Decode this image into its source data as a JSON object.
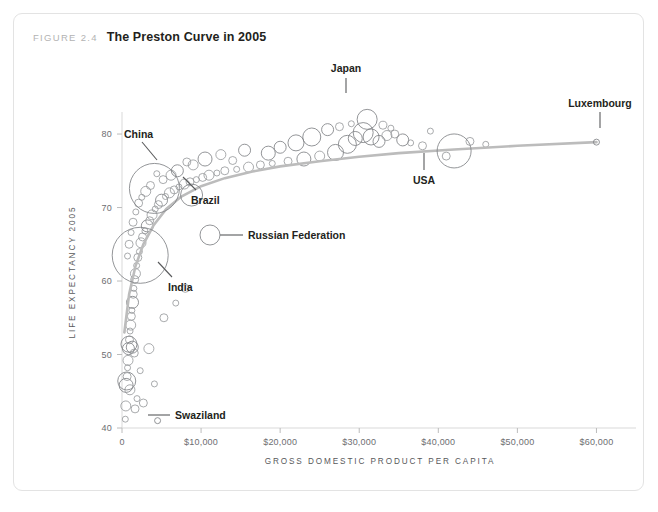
{
  "figure": {
    "number_label": "FIGURE 2.4",
    "title": "The Preston Curve in 2005"
  },
  "chart_data": {
    "type": "scatter",
    "title": "The Preston Curve in 2005",
    "xlabel": "GROSS DOMESTIC PRODUCT PER CAPITA",
    "ylabel": "LIFE EXPECTANCY 2005",
    "xlim": [
      0,
      65000
    ],
    "ylim": [
      40,
      83
    ],
    "grid": false,
    "legend": "none",
    "x_ticks": [
      0,
      10000,
      20000,
      30000,
      40000,
      50000,
      60000
    ],
    "x_tick_labels": [
      "0",
      "$10,000",
      "$20,000",
      "$30,000",
      "$40,000",
      "$50,000",
      "$60,000"
    ],
    "y_ticks": [
      40,
      50,
      60,
      70,
      80
    ],
    "y_tick_labels": [
      "40",
      "50",
      "60",
      "70",
      "80"
    ],
    "bubble_encoding": "population",
    "series_name": "Countries",
    "annotations": [
      {
        "label": "China",
        "x": 4100,
        "y": 72.6,
        "r": 25
      },
      {
        "label": "Brazil",
        "x": 8800,
        "y": 71.7,
        "r": 11
      },
      {
        "label": "Russian Federation",
        "x": 11900,
        "y": 65.5,
        "r": 10
      },
      {
        "label": "India",
        "x": 2300,
        "y": 63.5,
        "r": 28
      },
      {
        "label": "Japan",
        "x": 31000,
        "y": 82.0,
        "r": 10
      },
      {
        "label": "USA",
        "x": 42000,
        "y": 77.7,
        "r": 17
      },
      {
        "label": "Luxembourg",
        "x": 60000,
        "y": 78.9,
        "r": 3
      },
      {
        "label": "Swaziland",
        "x": 4500,
        "y": 41.0,
        "r": 3
      }
    ],
    "trend_curve": [
      [
        300,
        53.0
      ],
      [
        900,
        58.2
      ],
      [
        1700,
        62.0
      ],
      [
        2700,
        65.0
      ],
      [
        4000,
        67.6
      ],
      [
        5600,
        69.8
      ],
      [
        7500,
        71.5
      ],
      [
        10000,
        72.9
      ],
      [
        13000,
        74.0
      ],
      [
        16500,
        74.9
      ],
      [
        20000,
        75.6
      ],
      [
        25000,
        76.3
      ],
      [
        30000,
        76.9
      ],
      [
        35000,
        77.4
      ],
      [
        42000,
        77.9
      ],
      [
        50000,
        78.4
      ],
      [
        60000,
        78.9
      ]
    ],
    "points": [
      [
        420,
        41.2,
        3
      ],
      [
        480,
        43.0,
        5
      ],
      [
        520,
        45.8,
        7
      ],
      [
        600,
        46.4,
        9
      ],
      [
        650,
        47.0,
        4
      ],
      [
        700,
        48.2,
        3
      ],
      [
        760,
        49.2,
        5
      ],
      [
        820,
        50.8,
        6
      ],
      [
        880,
        51.4,
        8
      ],
      [
        950,
        52.0,
        4
      ],
      [
        1020,
        53.2,
        3
      ],
      [
        1100,
        54.0,
        5
      ],
      [
        1180,
        55.2,
        4
      ],
      [
        1250,
        56.0,
        3
      ],
      [
        1330,
        57.1,
        6
      ],
      [
        1420,
        58.2,
        4
      ],
      [
        1500,
        59.0,
        3
      ],
      [
        1600,
        60.2,
        4
      ],
      [
        1700,
        61.0,
        5
      ],
      [
        1850,
        62.1,
        3
      ],
      [
        2000,
        63.2,
        4
      ],
      [
        2200,
        64.0,
        3
      ],
      [
        2400,
        65.2,
        5
      ],
      [
        2600,
        66.0,
        4
      ],
      [
        2900,
        66.8,
        3
      ],
      [
        3200,
        67.5,
        6
      ],
      [
        3500,
        68.2,
        4
      ],
      [
        3800,
        69.0,
        5
      ],
      [
        4200,
        69.8,
        3
      ],
      [
        4600,
        70.4,
        4
      ],
      [
        5000,
        71.0,
        6
      ],
      [
        5500,
        71.5,
        3
      ],
      [
        6000,
        72.0,
        5
      ],
      [
        6600,
        72.4,
        4
      ],
      [
        7200,
        72.8,
        3
      ],
      [
        7900,
        73.2,
        5
      ],
      [
        8600,
        73.5,
        4
      ],
      [
        9400,
        73.8,
        3
      ],
      [
        10200,
        74.1,
        4
      ],
      [
        11000,
        74.4,
        5
      ],
      [
        12000,
        74.7,
        3
      ],
      [
        13000,
        75.0,
        4
      ],
      [
        14500,
        75.2,
        3
      ],
      [
        16000,
        75.5,
        5
      ],
      [
        17500,
        75.8,
        4
      ],
      [
        19000,
        76.0,
        3
      ],
      [
        21000,
        76.3,
        4
      ],
      [
        23000,
        76.6,
        7
      ],
      [
        25000,
        77.0,
        5
      ],
      [
        27000,
        77.5,
        8
      ],
      [
        28500,
        78.6,
        9
      ],
      [
        29500,
        79.4,
        7
      ],
      [
        30500,
        80.2,
        10
      ],
      [
        31500,
        79.6,
        8
      ],
      [
        32500,
        79.0,
        6
      ],
      [
        33500,
        79.8,
        5
      ],
      [
        34500,
        80.0,
        4
      ],
      [
        35500,
        79.2,
        6
      ],
      [
        36500,
        78.8,
        3
      ],
      [
        38000,
        78.4,
        4
      ],
      [
        24000,
        79.6,
        9
      ],
      [
        22000,
        78.8,
        8
      ],
      [
        20000,
        78.2,
        6
      ],
      [
        18500,
        77.4,
        7
      ],
      [
        26000,
        80.6,
        6
      ],
      [
        27500,
        81.0,
        4
      ],
      [
        29000,
        81.4,
        3
      ],
      [
        33000,
        81.2,
        4
      ],
      [
        34000,
        80.8,
        3
      ],
      [
        12500,
        77.2,
        5
      ],
      [
        14000,
        76.4,
        4
      ],
      [
        15500,
        77.8,
        6
      ],
      [
        10500,
        76.6,
        7
      ],
      [
        9000,
        75.8,
        5
      ],
      [
        8200,
        76.2,
        4
      ],
      [
        7000,
        75.0,
        6
      ],
      [
        6200,
        74.4,
        5
      ],
      [
        5200,
        73.8,
        4
      ],
      [
        4400,
        74.6,
        3
      ],
      [
        3600,
        73.0,
        4
      ],
      [
        3000,
        72.2,
        5
      ],
      [
        2500,
        71.4,
        3
      ],
      [
        2100,
        70.6,
        4
      ],
      [
        1750,
        69.4,
        3
      ],
      [
        1400,
        68.0,
        4
      ],
      [
        1150,
        66.6,
        3
      ],
      [
        900,
        65.0,
        4
      ],
      [
        700,
        63.4,
        3
      ],
      [
        1300,
        51.0,
        6
      ],
      [
        1550,
        50.2,
        4
      ],
      [
        1000,
        45.2,
        5
      ],
      [
        1900,
        44.0,
        3
      ],
      [
        2700,
        43.4,
        4
      ],
      [
        3400,
        50.8,
        5
      ],
      [
        4100,
        46.0,
        3
      ],
      [
        1650,
        42.6,
        4
      ],
      [
        2300,
        47.8,
        3
      ],
      [
        5300,
        55.0,
        4
      ],
      [
        6800,
        57.0,
        3
      ],
      [
        8000,
        59.0,
        4
      ],
      [
        44000,
        79.0,
        4
      ],
      [
        46000,
        78.6,
        3
      ],
      [
        39000,
        80.4,
        3
      ],
      [
        41000,
        77.0,
        4
      ]
    ]
  },
  "axes": {
    "x_title": "GROSS DOMESTIC PRODUCT PER CAPITA",
    "y_title": "LIFE EXPECTANCY 2005"
  },
  "colors": {
    "bubble_stroke": "#808285",
    "trend_line": "#bcbcbc",
    "axis": "#d9d9d9",
    "text": "#231f20",
    "tick_text": "#6d6e71",
    "caption_muted": "#b3b3b3",
    "border": "#e3e3e3"
  }
}
